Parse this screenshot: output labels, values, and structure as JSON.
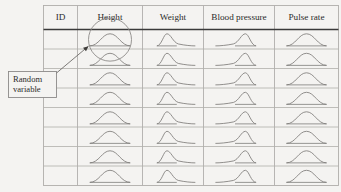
{
  "figure": {
    "background_color": "#f4f3f1",
    "line_color": "#b0aeab",
    "heavy_line_color": "#3a3a3a",
    "curve_color": "#7e7c7a",
    "text_color": "#2b2b2b"
  },
  "table": {
    "columns": [
      {
        "id": "id",
        "label": "ID",
        "distribution": "none"
      },
      {
        "id": "height",
        "label": "Height",
        "distribution": "symmetric"
      },
      {
        "id": "weight",
        "label": "Weight",
        "distribution": "right-skewed"
      },
      {
        "id": "blood_pressure",
        "label": "Blood pressure",
        "distribution": "left-skewed"
      },
      {
        "id": "pulse_rate",
        "label": "Pulse rate",
        "distribution": "symmetric"
      }
    ],
    "row_count": 8,
    "rows": [
      {
        "index": 1,
        "id_value": ""
      },
      {
        "index": 2,
        "id_value": ""
      },
      {
        "index": 3,
        "id_value": ""
      },
      {
        "index": 4,
        "id_value": ""
      },
      {
        "index": 5,
        "id_value": ""
      },
      {
        "index": 6,
        "id_value": ""
      },
      {
        "index": 7,
        "id_value": ""
      },
      {
        "index": 8,
        "id_value": ""
      }
    ]
  },
  "annotation": {
    "callout_line_1": "Random",
    "callout_line_2": "variable",
    "highlight_target_column": "Height",
    "highlight_target_row": 1
  },
  "chart_data": {
    "type": "line",
    "xlabel": "",
    "ylabel": "",
    "grid": true,
    "legend": "none",
    "series": [
      {
        "name": "Height",
        "shape": "symmetric",
        "skew": 0.0,
        "peak_position": 0.5
      },
      {
        "name": "Weight",
        "shape": "right-skewed",
        "skew": 1.0,
        "peak_position": 0.3
      },
      {
        "name": "Blood pressure",
        "shape": "left-skewed",
        "skew": -1.0,
        "peak_position": 0.72
      },
      {
        "name": "Pulse rate",
        "shape": "symmetric",
        "skew": 0.0,
        "peak_position": 0.5
      }
    ],
    "categories": [
      "ID",
      "Height",
      "Weight",
      "Blood pressure",
      "Pulse rate"
    ],
    "values": [
      0,
      1,
      1,
      1,
      1
    ]
  }
}
